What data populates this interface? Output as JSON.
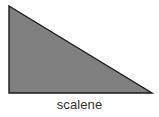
{
  "figure": {
    "background_color": "#ffffff",
    "caption": "scalene"
  },
  "shape": {
    "name": "scalene-triangle",
    "type": "triangle",
    "fill_color": "#808080",
    "stroke_color": "#1a1a1a",
    "stroke_width": 1.4,
    "points": "9,6 152,93 9,93",
    "vertices": [
      {
        "label": "apex",
        "x": 9,
        "y": 6
      },
      {
        "label": "bottom-right",
        "x": 152,
        "y": 93
      },
      {
        "label": "bottom-left",
        "x": 9,
        "y": 93
      }
    ]
  }
}
